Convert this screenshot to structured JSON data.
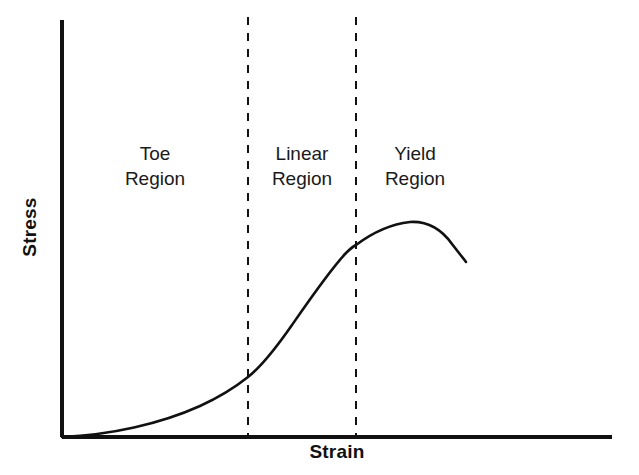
{
  "figure": {
    "background_color": "#ffffff",
    "ink_color": "#111111",
    "width": 639,
    "height": 475
  },
  "axes": {
    "y_label": "Stress",
    "x_label": "Strain",
    "y_axis": {
      "x": 62,
      "y_top": 20,
      "y_bottom": 437
    },
    "x_axis": {
      "y": 437,
      "x_left": 62,
      "x_right": 612
    },
    "axis_color": "#111111",
    "axis_width": 4
  },
  "regions": [
    {
      "id": "toe",
      "line1": "Toe",
      "line2": "Region",
      "center_x": 155,
      "x_start": 62,
      "x_end": 248
    },
    {
      "id": "linear",
      "line1": "Linear",
      "line2": "Region",
      "center_x": 302,
      "x_start": 248,
      "x_end": 356
    },
    {
      "id": "yield",
      "line1": "Yield",
      "line2": "Region",
      "center_x": 415,
      "x_start": 356,
      "x_end": 612
    }
  ],
  "dividers": [
    {
      "id": "toe-linear-divider",
      "x": 248,
      "y_top": 17,
      "y_bottom": 437
    },
    {
      "id": "linear-yield-divider",
      "x": 356,
      "y_top": 17,
      "y_bottom": 437
    }
  ],
  "divider_style": {
    "color": "#111111",
    "width": 2,
    "dash": "8 8"
  },
  "curve": {
    "color": "#111111",
    "width": 2.6,
    "path": "M 62 437 C 110 435, 160 424, 200 406 C 224 395, 238 385, 248 377 C 262 366, 276 348, 292 325 C 310 299, 330 270, 346 253 C 351 248, 354 246, 356 245 C 372 233, 392 224, 410 222 C 428 221, 442 230, 452 244 C 459 253, 463 258, 466 262"
  },
  "chart_data": {
    "type": "line",
    "title": "",
    "xlabel": "Strain",
    "ylabel": "Stress",
    "x_tick_labels": [],
    "y_tick_labels": [],
    "grid": false,
    "legend": false,
    "annotations": [
      {
        "text": "Toe Region",
        "region": "toe"
      },
      {
        "text": "Linear Region",
        "region": "linear"
      },
      {
        "text": "Yield Region",
        "region": "yield"
      }
    ],
    "series": [
      {
        "name": "Stress-strain curve",
        "x": [
          0.0,
          0.09,
          0.18,
          0.25,
          0.34,
          0.42,
          0.47,
          0.53,
          0.63,
          0.73,
          0.8,
          0.86
        ],
        "y": [
          0.0,
          0.01,
          0.04,
          0.08,
          0.14,
          0.27,
          0.37,
          0.46,
          0.5,
          0.52,
          0.5,
          0.42
        ]
      }
    ],
    "xlim": [
      0,
      1
    ],
    "ylim": [
      0,
      1
    ]
  }
}
